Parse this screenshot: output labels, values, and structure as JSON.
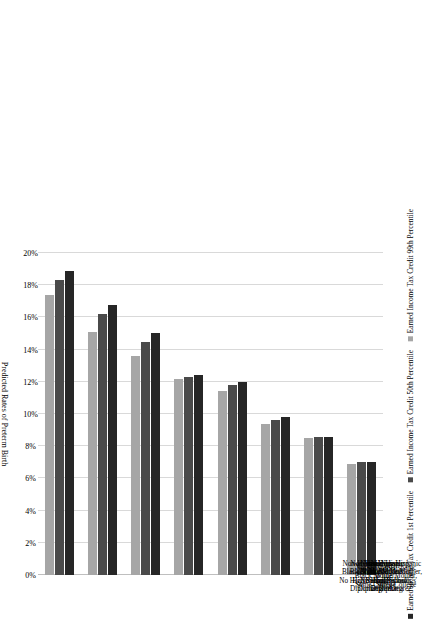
{
  "chart_data": {
    "type": "bar",
    "orientation": "horizontal",
    "title": "",
    "xlabel": "Predicted Rates of Preterm Birth",
    "ylabel": "",
    "xlim": [
      0,
      20
    ],
    "xticks": [
      "0%",
      "2%",
      "4%",
      "6%",
      "8%",
      "10%",
      "12%",
      "14%",
      "16%",
      "18%",
      "20%"
    ],
    "xtick_values": [
      0,
      2,
      4,
      6,
      8,
      10,
      12,
      14,
      16,
      18,
      20
    ],
    "grid": true,
    "legend_position": "bottom",
    "categories": [
      "Non-Hispanic\nBlack Mother,\nNo High School\nDiploma",
      "Non-Hispanic\nBlack Mother,\nHigh School\nDiploma",
      "Non-Hispanic\nBlack Mother,\nSome College",
      "Non-Hispanic\nBlack Mother,\nBachelor's\nDegree",
      "Non-Hispanic\nWhite Mother,\nNo High School\nDiploma",
      "Non-Hispanic\nWhite Mother,\nHigh School\nDiploma",
      "Non-Hispanic\nWhite Mother,\nSome College",
      "Non-Hispanic\nWhite Mother,\nBachelor's\nDegree"
    ],
    "series": [
      {
        "name": "Earned Income Tax Credit 1st Percentile",
        "color": "#262626",
        "values": [
          18.9,
          16.8,
          15.0,
          12.4,
          12.0,
          9.8,
          8.6,
          7.0
        ]
      },
      {
        "name": "Earned Income Tax Credit 50th Percentile",
        "color": "#4a4a4a",
        "values": [
          18.3,
          16.2,
          14.5,
          12.3,
          11.8,
          9.6,
          8.6,
          7.0
        ]
      },
      {
        "name": "Earned Income Tax Credit 99th Percentile",
        "color": "#a6a6a6",
        "values": [
          17.4,
          15.1,
          13.6,
          12.2,
          11.4,
          9.4,
          8.5,
          6.9
        ]
      }
    ]
  }
}
